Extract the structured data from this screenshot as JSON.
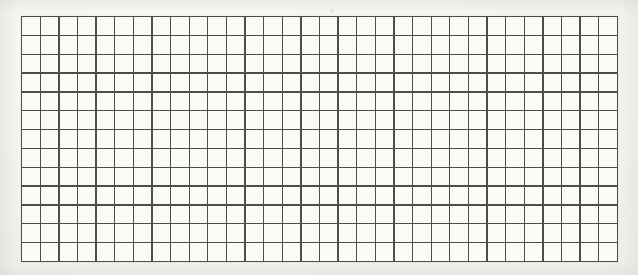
{
  "document": {
    "kind": "graph-paper-grid",
    "title": "Blank square grid",
    "caption": "",
    "background_color": "#f3f2ef"
  },
  "grid": {
    "columns": 32,
    "rows": 13,
    "cell_count": 416,
    "cell_width_px": 18.6,
    "cell_height_px": 18.9,
    "line_color": "#4a4a4a",
    "line_width_px": 1.35,
    "cell_fill_color": "#fbfaf7",
    "origin_x_px": 21,
    "origin_y_px": 16,
    "width_px": 597,
    "height_px": 246,
    "cell_labels": []
  },
  "chart_data": {
    "type": "table",
    "title": "",
    "xlabel": "",
    "ylabel": "",
    "columns": 32,
    "rows": 13,
    "values": []
  }
}
